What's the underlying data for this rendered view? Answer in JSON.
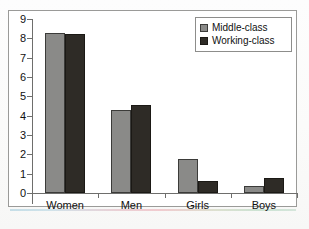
{
  "chart_data": {
    "type": "bar",
    "title": "",
    "subtitle": "",
    "xlabel": "",
    "ylabel": "",
    "categories": [
      "Women",
      "Men",
      "Girls",
      "Boys"
    ],
    "series": [
      {
        "name": "Middle-class",
        "color": "#8a8a88",
        "values": [
          8.3,
          4.3,
          1.75,
          0.35
        ]
      },
      {
        "name": "Working-class",
        "color": "#2e2b26",
        "values": [
          8.2,
          4.55,
          0.62,
          0.78
        ]
      }
    ],
    "ylim": [
      0,
      9
    ],
    "yticks": [
      0,
      1,
      2,
      3,
      4,
      5,
      6,
      7,
      8,
      9
    ],
    "ytick_labels": [
      "0",
      "1",
      "2",
      "3",
      "4",
      "5",
      "6",
      "7",
      "8",
      "9"
    ],
    "grid": false,
    "legend": {
      "position": "top-right",
      "entries": [
        "Middle-class",
        "Working-class"
      ]
    },
    "annotations": []
  },
  "legend": {
    "entries": [
      {
        "label": "Middle-class",
        "swatch": "legend-swatch-middle-class"
      },
      {
        "label": "Working-class",
        "swatch": "legend-swatch-working-class"
      }
    ]
  },
  "axes": {
    "y_labels": [
      "9",
      "8",
      "7",
      "6",
      "5",
      "4",
      "3",
      "2",
      "1",
      "0"
    ],
    "x_labels": [
      "Women",
      "Men",
      "Girls",
      "Boys"
    ]
  },
  "colors": {
    "middle_class": "#8a8a88",
    "working_class": "#2e2b26",
    "axis": "#6e6e6c",
    "frame": "#9a9a98",
    "text": "#111111"
  }
}
